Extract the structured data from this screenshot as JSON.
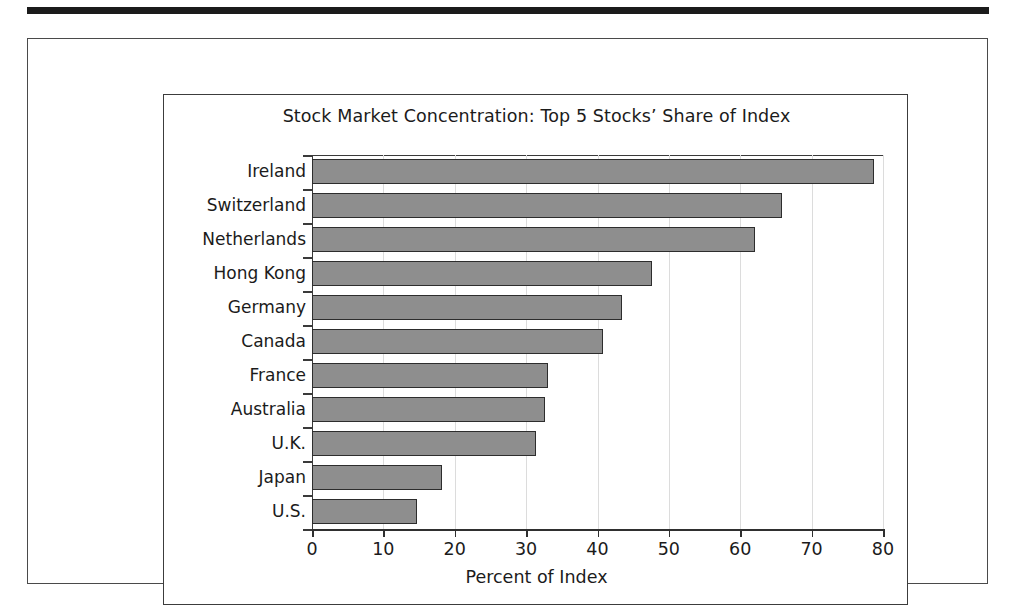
{
  "figure": {
    "title": "Stock Market Concentration: Top 5 Stocks’ Share of Index"
  },
  "chart_data": {
    "type": "bar",
    "orientation": "horizontal",
    "title": "Stock Market Concentration: Top 5 Stocks’ Share of Index",
    "xlabel": "Percent of Index",
    "ylabel": "",
    "xlim": [
      0,
      80
    ],
    "xticks": [
      0,
      10,
      20,
      30,
      40,
      50,
      60,
      70,
      80
    ],
    "xtick_labels": [
      "0",
      "10",
      "20",
      "30",
      "40",
      "50",
      "60",
      "70",
      "80"
    ],
    "grid": "vertical",
    "legend": "none",
    "categories": [
      "Ireland",
      "Switzerland",
      "Netherlands",
      "Hong Kong",
      "Germany",
      "Canada",
      "France",
      "Australia",
      "U.K.",
      "Japan",
      "U.S."
    ],
    "values": [
      78.7,
      65.8,
      62.0,
      47.6,
      43.5,
      40.8,
      33.0,
      32.6,
      31.4,
      18.2,
      14.7
    ],
    "bar_color": "#8e8e8e",
    "bar_edge_color": "#2d2d2d",
    "gridline_color": "#dcdcdc"
  }
}
